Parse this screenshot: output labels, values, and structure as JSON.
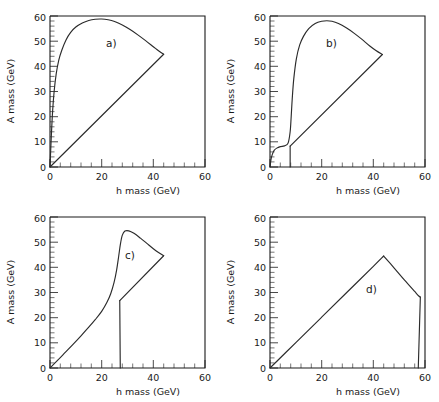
{
  "figure": {
    "panels_count": 4,
    "axis": {
      "xlabel": "h mass (GeV)",
      "ylabel": "A mass (GeV)",
      "xticks": [
        "0",
        "20",
        "40",
        "60"
      ],
      "yticks": [
        "0",
        "10",
        "20",
        "30",
        "40",
        "50",
        "60"
      ],
      "xlim": [
        0,
        60
      ],
      "ylim": [
        0,
        60
      ]
    },
    "labels": {
      "a": "a)",
      "b": "b)",
      "c": "c)",
      "d": "d)"
    },
    "colors": {
      "curve": "#2b2b2b",
      "axis": "#1a1a1a",
      "background": "#ffffff"
    }
  },
  "chart_data": [
    {
      "type": "line",
      "title": "a)",
      "xlabel": "h mass (GeV)",
      "ylabel": "A mass (GeV)",
      "xlim": [
        0,
        60
      ],
      "ylim": [
        0,
        60
      ],
      "grid": false,
      "legend": "none",
      "xticks": [
        0,
        20,
        40,
        60
      ],
      "yticks": [
        0,
        10,
        20,
        30,
        40,
        50,
        60
      ],
      "series": [
        {
          "name": "upper-boundary",
          "x": [
            0,
            0.5,
            1.0,
            1.6,
            2.4,
            3.4,
            4.6,
            6.2,
            8.0,
            10.0,
            12.5,
            15.0,
            17.5,
            20.0,
            22.5,
            25.0,
            28.0,
            31.0,
            34.0,
            37.0,
            40.0,
            42.0,
            44.0
          ],
          "y": [
            0,
            12,
            22,
            30,
            37,
            42.5,
            46.5,
            50.5,
            53.5,
            55.6,
            57.2,
            58.2,
            58.7,
            58.8,
            58.5,
            57.8,
            56.4,
            54.6,
            52.5,
            50.2,
            47.8,
            46.2,
            44.8
          ]
        },
        {
          "name": "lower-boundary",
          "x": [
            0,
            44
          ],
          "y": [
            0,
            44.8
          ]
        }
      ]
    },
    {
      "type": "line",
      "title": "b)",
      "xlabel": "h mass (GeV)",
      "ylabel": "A mass (GeV)",
      "xlim": [
        0,
        60
      ],
      "ylim": [
        0,
        60
      ],
      "grid": false,
      "legend": "none",
      "xticks": [
        0,
        20,
        40,
        60
      ],
      "yticks": [
        0,
        10,
        20,
        30,
        40,
        50,
        60
      ],
      "series": [
        {
          "name": "upper-boundary",
          "x": [
            0,
            0.4,
            0.9,
            1.6,
            2.6,
            4.0,
            5.6,
            7.0,
            7.8,
            8.2,
            8.6,
            9.2,
            10.2,
            11.5,
            13.0,
            15.0,
            17.5,
            20.0,
            22.0,
            24.0,
            26.5,
            29.5,
            32.5,
            35.5,
            38.5,
            41.0,
            43.5
          ],
          "y": [
            0,
            3.0,
            5.0,
            6.6,
            7.5,
            8.1,
            8.4,
            9.5,
            14.0,
            20.0,
            27.0,
            35.0,
            43.0,
            48.5,
            52.0,
            55.0,
            57.0,
            57.9,
            58.1,
            57.9,
            57.0,
            55.3,
            53.2,
            50.8,
            48.2,
            46.3,
            44.7
          ]
        },
        {
          "name": "vertical-cut",
          "x": [
            7.8,
            7.8
          ],
          "y": [
            0,
            8.3
          ]
        },
        {
          "name": "lower-boundary",
          "x": [
            7.8,
            43.5
          ],
          "y": [
            8.3,
            44.7
          ]
        }
      ]
    },
    {
      "type": "line",
      "title": "c)",
      "xlabel": "h mass (GeV)",
      "ylabel": "A mass (GeV)",
      "xlim": [
        0,
        60
      ],
      "ylim": [
        0,
        60
      ],
      "grid": false,
      "legend": "none",
      "xticks": [
        0,
        20,
        40,
        60
      ],
      "yticks": [
        0,
        10,
        20,
        30,
        40,
        50,
        60
      ],
      "series": [
        {
          "name": "upper-boundary",
          "x": [
            0,
            3.0,
            6.0,
            9.0,
            12.0,
            15.0,
            17.5,
            20.0,
            22.0,
            23.5,
            24.8,
            25.8,
            26.6,
            27.3,
            28.0,
            29.0,
            30.5,
            32.5,
            35.0,
            37.5,
            40.0,
            42.0,
            44.0
          ],
          "y": [
            0,
            3.1,
            6.3,
            9.5,
            12.8,
            16.2,
            19.2,
            22.5,
            26.0,
            29.5,
            34.0,
            39.0,
            44.5,
            49.5,
            52.8,
            54.4,
            54.5,
            53.5,
            51.6,
            49.5,
            47.4,
            45.9,
            44.6
          ]
        },
        {
          "name": "inner-lower-boundary",
          "x": [
            27.0,
            44.0
          ],
          "y": [
            26.8,
            44.6
          ]
        },
        {
          "name": "vertical-cut",
          "x": [
            27.0,
            27.2
          ],
          "y": [
            26.8,
            0
          ]
        }
      ]
    },
    {
      "type": "line",
      "title": "d)",
      "xlabel": "h mass (GeV)",
      "ylabel": "A mass (GeV)",
      "xlim": [
        0,
        60
      ],
      "ylim": [
        0,
        60
      ],
      "grid": false,
      "legend": "none",
      "xticks": [
        0,
        20,
        40,
        60
      ],
      "yticks": [
        0,
        10,
        20,
        30,
        40,
        50,
        60
      ],
      "series": [
        {
          "name": "rising-boundary",
          "x": [
            0,
            10,
            20,
            30,
            40,
            44.0
          ],
          "y": [
            0,
            10.1,
            20.2,
            30.3,
            40.4,
            44.5
          ]
        },
        {
          "name": "falling-boundary",
          "x": [
            44.0,
            48.0,
            52.0,
            56.0,
            57.6,
            58.2
          ],
          "y": [
            44.5,
            39.8,
            35.0,
            30.4,
            28.6,
            28.2
          ]
        },
        {
          "name": "vertical-cut",
          "x": [
            58.2,
            57.4
          ],
          "y": [
            28.2,
            0
          ]
        }
      ]
    }
  ]
}
